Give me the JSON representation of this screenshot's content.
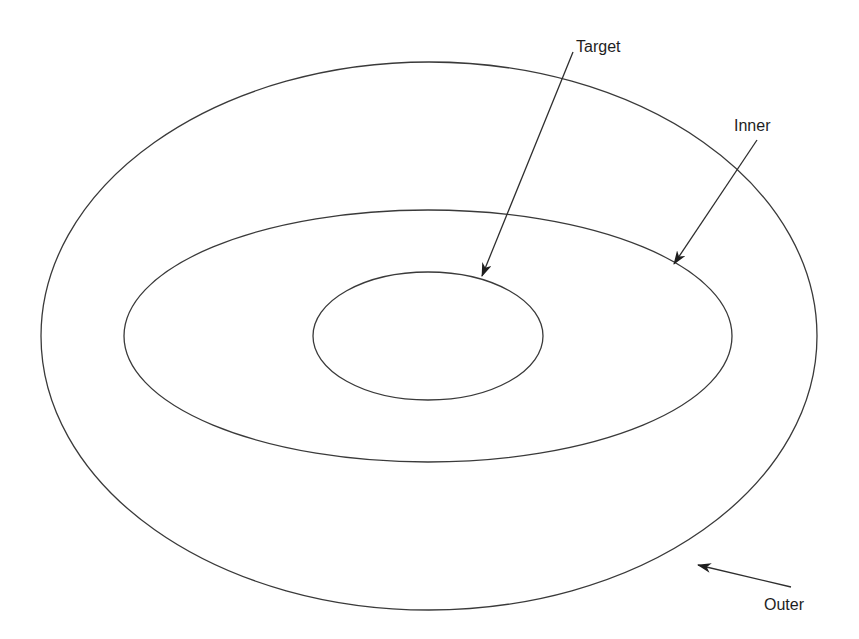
{
  "diagram": {
    "type": "concentric-ellipses",
    "background": "#ffffff",
    "stroke_color": "#3a3a3a",
    "ellipses": [
      {
        "name": "outer",
        "cx": 429,
        "cy": 336,
        "rx": 388,
        "ry": 274
      },
      {
        "name": "inner",
        "cx": 428,
        "cy": 336,
        "rx": 304,
        "ry": 126
      },
      {
        "name": "target",
        "cx": 428,
        "cy": 336,
        "rx": 115,
        "ry": 64
      }
    ],
    "labels": {
      "target": "Target",
      "inner": "Inner",
      "outer": "Outer"
    },
    "arrows": [
      {
        "label": "Target",
        "from": [
          573,
          52
        ],
        "to": [
          482,
          276
        ]
      },
      {
        "label": "Inner",
        "from": [
          757,
          140
        ],
        "to": [
          674,
          264
        ]
      },
      {
        "label": "Outer",
        "from": [
          791,
          587
        ],
        "to": [
          698,
          565
        ]
      }
    ]
  }
}
